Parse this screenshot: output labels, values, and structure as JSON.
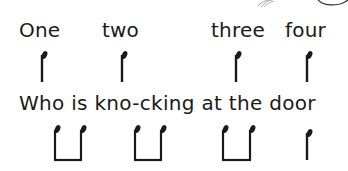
{
  "row1": {
    "words": [
      {
        "text": "One",
        "x": 19,
        "y": 20
      },
      {
        "text": "two",
        "x": 102,
        "y": 20
      },
      {
        "text": "three",
        "x": 211,
        "y": 20
      },
      {
        "text": "four",
        "x": 285,
        "y": 20
      }
    ],
    "notes": [
      {
        "type": "crotchet",
        "x": 42
      },
      {
        "type": "crotchet",
        "x": 122
      },
      {
        "type": "crotchet",
        "x": 236
      },
      {
        "type": "crotchet",
        "x": 307
      }
    ]
  },
  "row2": {
    "lyric": "Who is kno-cking at the door",
    "x": 19,
    "y": 93,
    "notes": [
      {
        "type": "quaver-pair",
        "x1": 54,
        "x2": 80
      },
      {
        "type": "quaver-pair",
        "x1": 134,
        "x2": 160
      },
      {
        "type": "quaver-pair",
        "x1": 223,
        "x2": 250
      },
      {
        "type": "crotchet",
        "x": 307
      }
    ]
  },
  "colors": {
    "ink": "#1a1a1a",
    "background": "#ffffff",
    "decoration": "#9a9a9a"
  }
}
